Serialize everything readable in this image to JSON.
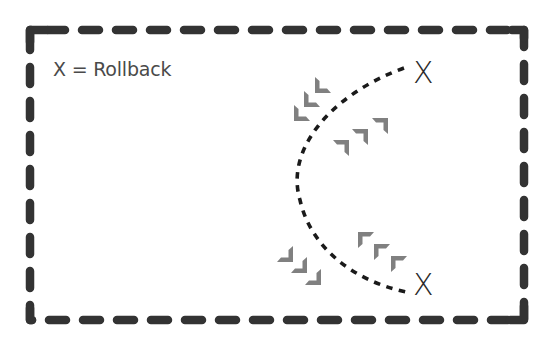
{
  "diagram": {
    "legend": "X = Rollback",
    "markers": {
      "top": "X",
      "bottom": "X"
    },
    "colors": {
      "border": "#333333",
      "path": "#1a1a1a",
      "chevron": "#808080",
      "text": "#4a4a4a"
    },
    "chevron_groups": [
      {
        "name": "upper-left-chevrons",
        "direction": "down-left",
        "count": 3
      },
      {
        "name": "upper-right-chevrons",
        "direction": "up-right",
        "count": 3
      },
      {
        "name": "lower-left-chevrons",
        "direction": "down-right",
        "count": 3
      },
      {
        "name": "lower-right-chevrons",
        "direction": "up-left",
        "count": 3
      }
    ]
  }
}
